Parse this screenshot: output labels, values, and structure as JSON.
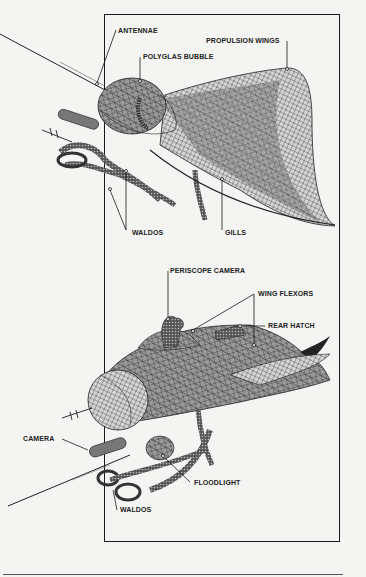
{
  "diagram": {
    "upper_view": {
      "labels": [
        {
          "id": "antennae",
          "text": "ANTENNAE"
        },
        {
          "id": "propulsion-wings",
          "text": "PROPULSION WINGS"
        },
        {
          "id": "polyglas-bubble",
          "text": "POLYGLAS BUBBLE"
        },
        {
          "id": "waldos",
          "text": "WALDOS"
        },
        {
          "id": "gills",
          "text": "GILLS"
        }
      ]
    },
    "lower_view": {
      "labels": [
        {
          "id": "periscope-camera",
          "text": "PERISCOPE CAMERA"
        },
        {
          "id": "wing-flexors",
          "text": "WING FLEXORS"
        },
        {
          "id": "rear-hatch",
          "text": "REAR HATCH"
        },
        {
          "id": "camera",
          "text": "CAMERA"
        },
        {
          "id": "floodlight",
          "text": "FLOODLIGHT"
        },
        {
          "id": "waldos",
          "text": "WALDOS"
        }
      ]
    },
    "colors": {
      "background": "#f4f4f2",
      "line": "#1a1a1a",
      "mesh_dark": "#6e6e6e",
      "mesh_mid": "#9a9a9a",
      "mesh_light": "#d0d0d0"
    }
  }
}
